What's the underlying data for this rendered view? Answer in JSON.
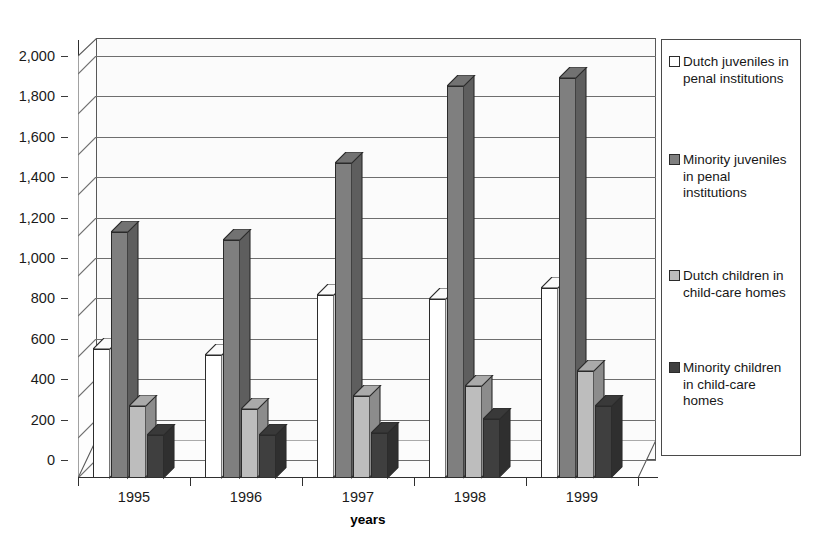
{
  "chart_data": {
    "type": "bar",
    "title": "",
    "subtitle": "",
    "xlabel": "years",
    "ylabel": "",
    "categories": [
      "1995",
      "1996",
      "1997",
      "1998",
      "1999"
    ],
    "ylim": [
      0,
      2000
    ],
    "ytick_values": [
      0,
      200,
      400,
      600,
      800,
      1000,
      1200,
      1400,
      1600,
      1800,
      2000
    ],
    "ytick_labels": [
      "0",
      "200",
      "400",
      "600",
      "800",
      "1,000",
      "1,200",
      "1,400",
      "1,600",
      "1,800",
      "2,000"
    ],
    "grid": true,
    "grid_axis": "y",
    "legend_position": "right",
    "style": "3d-clustered-column",
    "series": [
      {
        "name": "Dutch juveniles in penal institutions",
        "color": "#ffffff",
        "values": [
          640,
          610,
          905,
          885,
          940
        ]
      },
      {
        "name": "Minority juveniles in penal institutions",
        "color": "#7f7f7f",
        "values": [
          1220,
          1180,
          1560,
          1940,
          1980
        ]
      },
      {
        "name": "Dutch children in child-care homes",
        "color": "#bdbdbd",
        "values": [
          355,
          340,
          405,
          455,
          530
        ]
      },
      {
        "name": "Minority children in child-care homes",
        "color": "#3f3f3f",
        "values": [
          215,
          215,
          225,
          290,
          355
        ]
      }
    ]
  },
  "legend": {
    "entries": [
      {
        "label": "Dutch juveniles in penal institutions",
        "color": "#ffffff"
      },
      {
        "label": "Minority juveniles in penal institutions",
        "color": "#7f7f7f"
      },
      {
        "label": "Dutch children in child-care homes",
        "color": "#bdbdbd"
      },
      {
        "label": "Minority children in child-care homes",
        "color": "#3f3f3f"
      }
    ]
  },
  "axes": {
    "x_title": "years",
    "y_title": ""
  },
  "colors": {
    "series_1": "#ffffff",
    "series_2": "#7f7f7f",
    "series_3": "#bdbdbd",
    "series_4": "#3f3f3f",
    "axis": "#2f2f2f",
    "gridline": "#6e6e6e",
    "plot_background": "#fbfbfb",
    "page_background": "#ffffff"
  }
}
